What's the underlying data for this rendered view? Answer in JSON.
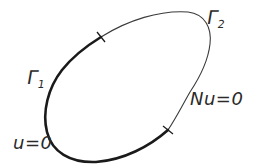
{
  "diagram": {
    "type": "boundary-domain",
    "colors": {
      "background": "#ffffff",
      "stroke": "#1e1e1e",
      "text": "#2a2a2a"
    },
    "boundaries": [
      {
        "id": "gamma1",
        "symbol": "Γ",
        "subscript": "1",
        "condition": "u=0",
        "stroke": "thick"
      },
      {
        "id": "gamma2",
        "symbol": "Γ",
        "subscript": "2",
        "condition": "Nu=0",
        "stroke": "thin"
      }
    ],
    "tick_marks": 2
  }
}
